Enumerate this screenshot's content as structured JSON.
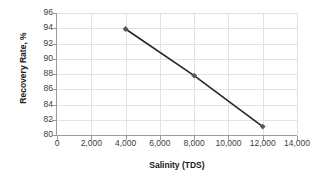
{
  "chart_data": {
    "type": "line",
    "title": "",
    "xlabel": "Salinity (TDS)",
    "ylabel": "Recovery Rate, %",
    "x": [
      4000,
      8000,
      12000
    ],
    "values": [
      93.9,
      87.8,
      81.1
    ],
    "series": [
      {
        "name": "Recovery Rate",
        "x": [
          4000,
          8000,
          12000
        ],
        "values": [
          93.9,
          87.8,
          81.1
        ]
      }
    ],
    "xlim": [
      0,
      14000
    ],
    "ylim": [
      80,
      96
    ],
    "xticks": [
      0,
      2000,
      4000,
      6000,
      8000,
      10000,
      12000,
      14000
    ],
    "xtick_labels": [
      "0",
      "2,000",
      "4,000",
      "6,000",
      "8,000",
      "10,000",
      "12,000",
      "14,000"
    ],
    "yticks": [
      80,
      82,
      84,
      86,
      88,
      90,
      92,
      94,
      96
    ],
    "ytick_labels": [
      "80",
      "82",
      "84",
      "86",
      "88",
      "90",
      "92",
      "94",
      "96"
    ],
    "grid": true,
    "grid_axes": "both",
    "legend": false,
    "legend_position": "none",
    "line_color": "#262626",
    "marker_color": "#595959",
    "marker": "diamond",
    "grid_color": "#e2e2e2",
    "axis_color": "#9a9a9a",
    "background": "#ffffff"
  },
  "axes": {
    "y_title": "Recovery Rate, %",
    "x_title": "Salinity (TDS)"
  }
}
